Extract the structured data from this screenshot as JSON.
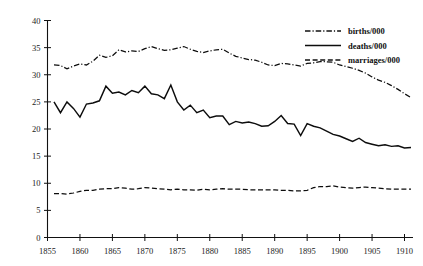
{
  "chart_data": {
    "type": "line",
    "title": "",
    "subtitle": "",
    "xlabel": "",
    "ylabel": "",
    "xlim": [
      1855,
      1911
    ],
    "ylim": [
      0,
      40
    ],
    "grid": false,
    "legend_position": "top-right",
    "xticks": [
      1855,
      1860,
      1865,
      1870,
      1875,
      1880,
      1885,
      1890,
      1895,
      1900,
      1905,
      1910
    ],
    "yticks": [
      0,
      5,
      10,
      15,
      20,
      25,
      30,
      35,
      40
    ],
    "x": [
      1856,
      1857,
      1858,
      1859,
      1860,
      1861,
      1862,
      1863,
      1864,
      1865,
      1866,
      1867,
      1868,
      1869,
      1870,
      1871,
      1872,
      1873,
      1874,
      1875,
      1876,
      1877,
      1878,
      1879,
      1880,
      1881,
      1882,
      1883,
      1884,
      1885,
      1886,
      1887,
      1888,
      1889,
      1890,
      1891,
      1892,
      1893,
      1894,
      1895,
      1896,
      1897,
      1898,
      1899,
      1900,
      1901,
      1902,
      1903,
      1904,
      1905,
      1906,
      1907,
      1908,
      1909,
      1910,
      1911
    ],
    "series": [
      {
        "name": "births/000",
        "style": "dash-dot",
        "color": "#111111",
        "values": [
          31.8,
          31.7,
          31.1,
          31.6,
          32.0,
          31.8,
          32.5,
          33.6,
          33.2,
          33.5,
          34.6,
          34.2,
          34.4,
          34.3,
          34.8,
          35.2,
          34.8,
          34.5,
          34.6,
          34.9,
          35.2,
          34.7,
          34.3,
          34.1,
          34.4,
          34.6,
          34.7,
          34.0,
          33.4,
          33.1,
          32.8,
          32.7,
          32.3,
          31.8,
          31.7,
          32.1,
          32.0,
          31.8,
          31.6,
          32.1,
          32.2,
          32.4,
          32.4,
          32.3,
          31.8,
          31.5,
          31.2,
          30.8,
          30.3,
          29.6,
          29.0,
          28.6,
          28.0,
          27.3,
          26.5,
          25.8
        ]
      },
      {
        "name": "deaths/000",
        "style": "solid",
        "color": "#0d0d0d",
        "values": [
          25.0,
          23.0,
          25.0,
          23.8,
          22.2,
          24.6,
          24.8,
          25.2,
          27.9,
          26.6,
          26.8,
          26.3,
          27.1,
          26.7,
          27.9,
          26.5,
          26.3,
          25.6,
          28.1,
          25.0,
          23.5,
          24.4,
          23.0,
          23.5,
          22.1,
          22.4,
          22.4,
          20.8,
          21.4,
          21.1,
          21.3,
          21.0,
          20.5,
          20.6,
          21.4,
          22.5,
          21.0,
          20.9,
          18.8,
          21.0,
          20.5,
          20.2,
          19.6,
          19.0,
          18.7,
          18.2,
          17.7,
          18.3,
          17.5,
          17.2,
          16.9,
          17.1,
          16.8,
          16.9,
          16.5,
          16.6
        ]
      },
      {
        "name": "marriages/000",
        "style": "dashed",
        "color": "#111111",
        "values": [
          8.1,
          8.1,
          8.0,
          8.2,
          8.5,
          8.7,
          8.7,
          8.9,
          9.0,
          9.0,
          9.2,
          9.1,
          8.9,
          9.0,
          9.2,
          9.1,
          9.0,
          8.9,
          8.8,
          8.9,
          8.8,
          8.8,
          8.7,
          8.9,
          8.8,
          8.9,
          9.0,
          8.9,
          8.9,
          8.9,
          8.8,
          8.8,
          8.8,
          8.8,
          8.8,
          8.7,
          8.7,
          8.6,
          8.6,
          8.7,
          9.2,
          9.4,
          9.4,
          9.5,
          9.3,
          9.2,
          9.1,
          9.2,
          9.3,
          9.2,
          9.1,
          9.0,
          8.9,
          8.9,
          8.9,
          8.9
        ]
      }
    ]
  },
  "legend": {
    "items": [
      {
        "label": "births/000"
      },
      {
        "label": "deaths/000"
      },
      {
        "label": "marriages/000"
      }
    ]
  },
  "axes": {
    "x_tick_labels": [
      "1855",
      "1860",
      "1865",
      "1870",
      "1875",
      "1880",
      "1885",
      "1890",
      "1895",
      "1900",
      "1905",
      "1910"
    ],
    "y_tick_labels": [
      "0",
      "5",
      "10",
      "15",
      "20",
      "25",
      "30",
      "35",
      "40"
    ]
  }
}
